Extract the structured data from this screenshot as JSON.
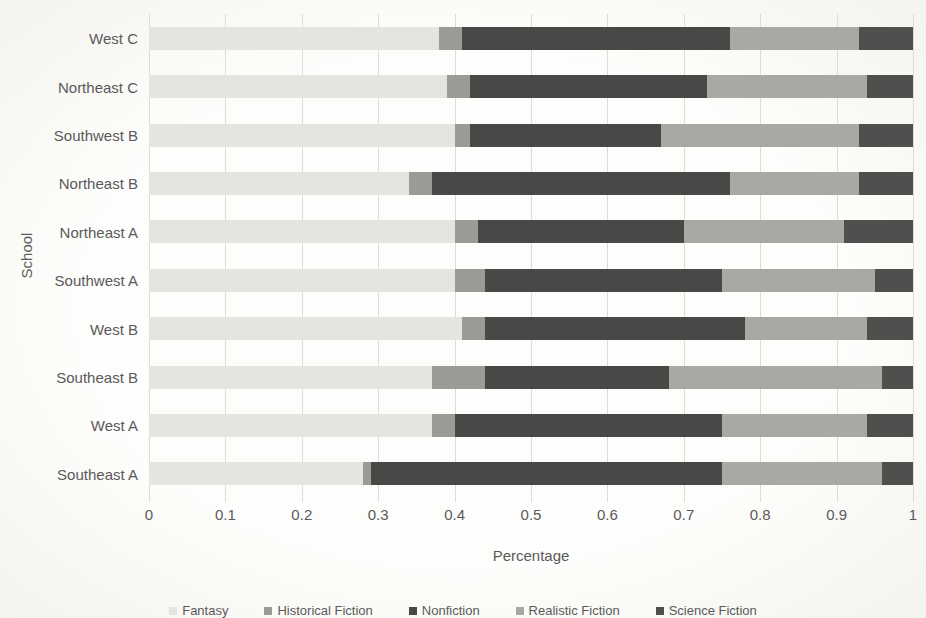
{
  "chart_data": {
    "type": "bar",
    "orientation": "horizontal",
    "stacked": true,
    "title": "",
    "xlabel": "Percentage",
    "ylabel": "School",
    "xlim": [
      0,
      1
    ],
    "xticks": [
      0,
      0.1,
      0.2,
      0.3,
      0.4,
      0.5,
      0.6,
      0.7,
      0.8,
      0.9,
      1
    ],
    "xtick_labels": [
      "0",
      "0.1",
      "0.2",
      "0.3",
      "0.4",
      "0.5",
      "0.6",
      "0.7",
      "0.8",
      "0.9",
      "1"
    ],
    "grid": "vertical",
    "legend_position": "bottom",
    "categories": [
      "West C",
      "Northeast C",
      "Southwest B",
      "Northeast B",
      "Northeast A",
      "Southwest A",
      "West B",
      "Southeast B",
      "West A",
      "Southeast A"
    ],
    "series": [
      {
        "name": "Fantasy",
        "color": "#e5e4e1",
        "values": [
          0.38,
          0.39,
          0.4,
          0.34,
          0.4,
          0.4,
          0.41,
          0.37,
          0.37,
          0.28
        ]
      },
      {
        "name": "Historical Fiction",
        "color": "#9b9a97",
        "values": [
          0.03,
          0.03,
          0.02,
          0.03,
          0.03,
          0.04,
          0.03,
          0.07,
          0.03,
          0.01
        ]
      },
      {
        "name": "Nonfiction",
        "color": "#484847",
        "values": [
          0.35,
          0.31,
          0.25,
          0.39,
          0.27,
          0.31,
          0.34,
          0.24,
          0.35,
          0.46
        ]
      },
      {
        "name": "Realistic Fiction",
        "color": "#a9a8a4",
        "values": [
          0.17,
          0.21,
          0.26,
          0.17,
          0.21,
          0.2,
          0.16,
          0.28,
          0.19,
          0.21
        ]
      },
      {
        "name": "Science Fiction",
        "color": "#4f4f4e",
        "values": [
          0.07,
          0.06,
          0.07,
          0.07,
          0.09,
          0.05,
          0.06,
          0.04,
          0.06,
          0.04
        ]
      }
    ]
  }
}
